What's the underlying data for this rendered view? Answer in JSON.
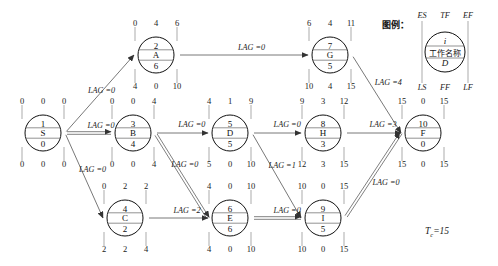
{
  "diagram": {
    "title_legend": "图例：",
    "project_duration": "T",
    "project_duration_sub": "c",
    "project_duration_value": "=15",
    "legend": {
      "top_left": "ES",
      "top_mid": "TF",
      "top_right": "EF",
      "bottom_left": "LS",
      "bottom_mid": "FF",
      "bottom_right": "LF",
      "node_id": "i",
      "node_name": "工作名称",
      "duration": "D"
    },
    "nodes": [
      {
        "key": "S",
        "id": "1",
        "name": "S",
        "duration": "0",
        "es": "0",
        "tf": "0",
        "ef": "0",
        "ls": "0",
        "ff": "0",
        "lf": "0",
        "cx": 43,
        "cy": 133,
        "r": 18
      },
      {
        "key": "A",
        "id": "2",
        "name": "A",
        "duration": "6",
        "es": "0",
        "tf": "4",
        "ef": "6",
        "ls": "4",
        "ff": "0",
        "lf": "10",
        "cx": 156,
        "cy": 55,
        "r": 18
      },
      {
        "key": "B",
        "id": "3",
        "name": "B",
        "duration": "4",
        "es": "0",
        "tf": "0",
        "ef": "4",
        "ls": "0",
        "ff": "0",
        "lf": "4",
        "cx": 133,
        "cy": 133,
        "r": 18
      },
      {
        "key": "C",
        "id": "4",
        "name": "C",
        "duration": "2",
        "es": "0",
        "tf": "2",
        "ef": "2",
        "ls": "2",
        "ff": "2",
        "lf": "4",
        "cx": 125,
        "cy": 218,
        "r": 18
      },
      {
        "key": "D",
        "id": "5",
        "name": "D",
        "duration": "5",
        "es": "4",
        "tf": "1",
        "ef": "9",
        "ls": "5",
        "ff": "0",
        "lf": "10",
        "cx": 230,
        "cy": 133,
        "r": 18
      },
      {
        "key": "E",
        "id": "6",
        "name": "E",
        "duration": "6",
        "es": "4",
        "tf": "0",
        "ef": "10",
        "ls": "4",
        "ff": "0",
        "lf": "10",
        "cx": 230,
        "cy": 218,
        "r": 18
      },
      {
        "key": "G",
        "id": "7",
        "name": "G",
        "duration": "5",
        "es": "6",
        "tf": "4",
        "ef": "11",
        "ls": "10",
        "ff": "4",
        "lf": "15",
        "cx": 330,
        "cy": 55,
        "r": 18
      },
      {
        "key": "H",
        "id": "8",
        "name": "H",
        "duration": "3",
        "es": "9",
        "tf": "3",
        "ef": "12",
        "ls": "12",
        "ff": "3",
        "lf": "15",
        "cx": 323,
        "cy": 133,
        "r": 18
      },
      {
        "key": "I",
        "id": "9",
        "name": "I",
        "duration": "5",
        "es": "10",
        "tf": "0",
        "ef": "15",
        "ls": "10",
        "ff": "0",
        "lf": "15",
        "cx": 323,
        "cy": 218,
        "r": 18
      },
      {
        "key": "F",
        "id": "10",
        "name": "F",
        "duration": "0",
        "es": "15",
        "tf": "0",
        "ef": "15",
        "ls": "15",
        "ff": "0",
        "lf": "15",
        "cx": 423,
        "cy": 133,
        "r": 18
      }
    ],
    "links": [
      {
        "from": "S",
        "to": "A",
        "lag": "LAG =0",
        "critical": false
      },
      {
        "from": "S",
        "to": "B",
        "lag": "LAG =0",
        "critical": true
      },
      {
        "from": "S",
        "to": "C",
        "lag": "LAG =0",
        "critical": false
      },
      {
        "from": "A",
        "to": "G",
        "lag": "LAG =0",
        "critical": false
      },
      {
        "from": "B",
        "to": "D",
        "lag": "LAG =0",
        "critical": false
      },
      {
        "from": "B",
        "to": "E",
        "lag": "LAG =0",
        "critical": true
      },
      {
        "from": "C",
        "to": "E",
        "lag": "LAG =2",
        "critical": false
      },
      {
        "from": "D",
        "to": "H",
        "lag": "LAG =0",
        "critical": false
      },
      {
        "from": "D",
        "to": "I",
        "lag": "LAG =1",
        "critical": false
      },
      {
        "from": "E",
        "to": "I",
        "lag": "LAG =0",
        "critical": true
      },
      {
        "from": "G",
        "to": "F",
        "lag": "LAG =4",
        "critical": false
      },
      {
        "from": "H",
        "to": "F",
        "lag": "LAG =3",
        "critical": false
      },
      {
        "from": "I",
        "to": "F",
        "lag": "LAG =0",
        "critical": true
      }
    ]
  }
}
